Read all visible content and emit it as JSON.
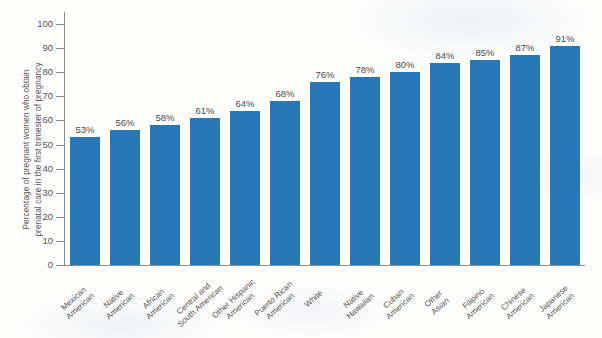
{
  "chart_data": {
    "type": "bar",
    "title": "",
    "xlabel": "",
    "ylabel": "Percentage of pregnant women who obtain\nprenatal care in the first trimester of pregnancy",
    "ylim": [
      0,
      105
    ],
    "grid": false,
    "legend": "none",
    "orientation": "vertical",
    "bar_color": "#2878b8",
    "value_label_suffix": "%",
    "axis": {
      "y_ticks": [
        0,
        10,
        20,
        30,
        40,
        50,
        60,
        70,
        80,
        90,
        100
      ],
      "y_tick_labels": [
        "0",
        "10",
        "20",
        "30",
        "40",
        "50",
        "60",
        "70",
        "80",
        "90",
        "100"
      ]
    },
    "categories": [
      "Mexican\nAmerican",
      "Native\nAmerican",
      "African\nAmerican",
      "Central and\nSouth American",
      "Other Hispanic\nAmerican",
      "Puerto Rican\nAmerican",
      "White",
      "Native\nHawaiian",
      "Cuban\nAmerican",
      "Other\nAsian",
      "Filipino\nAmerican",
      "Chinese\nAmerican",
      "Japanese\nAmerican"
    ],
    "values": [
      53,
      56,
      58,
      61,
      64,
      68,
      76,
      78,
      80,
      84,
      85,
      87,
      91
    ],
    "data_labels": [
      "53%",
      "56%",
      "58%",
      "61%",
      "64%",
      "68%",
      "76%",
      "78%",
      "80%",
      "84%",
      "85%",
      "87%",
      "91%"
    ]
  }
}
